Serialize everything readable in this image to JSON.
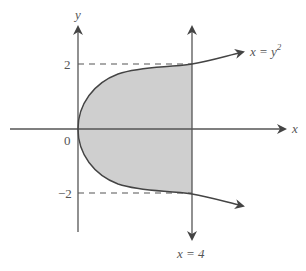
{
  "diagram": {
    "type": "region-between-curves",
    "labels": {
      "y_axis": "y",
      "x_axis": "x",
      "origin": "0",
      "tick_pos": "2",
      "tick_neg": "−2",
      "curve": "x = y",
      "curve_exp": "2",
      "line": "x = 4"
    },
    "colors": {
      "axis": "#555555",
      "curve": "#444444",
      "shade": "#cfcfcf",
      "dash": "#555555",
      "text": "#555555"
    },
    "elements": {
      "curve_equation": "x = y^2",
      "vertical_line_equation": "x = 4",
      "dashed_lines": [
        "y = 2",
        "y = -2"
      ],
      "shaded_region": "0 <= x <= 4, -sqrt(x) <= y <= sqrt(x)"
    }
  }
}
